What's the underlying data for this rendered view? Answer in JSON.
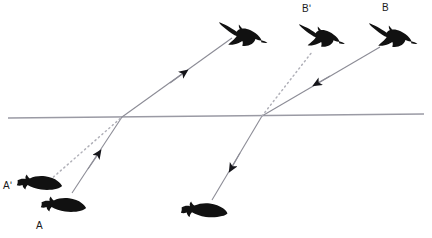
{
  "diagram": {
    "type": "optics-ray-diagram",
    "colors": {
      "background": "#ffffff",
      "silhouette": "#111111",
      "ray_solid": "#8c8c96",
      "ray_dotted": "#b8b8c0",
      "surface_line": "#9a9aa4",
      "label_text": "#1a1a1a"
    },
    "surface": {
      "name": "water-surface-line",
      "style": "solid",
      "x1": 8,
      "y1": 118,
      "x2": 424,
      "y2": 114
    },
    "labels": [
      {
        "id": "a-prime",
        "text": "Aʹ",
        "x": 3,
        "y": 181,
        "describes": "apparent-position-of-fish"
      },
      {
        "id": "a",
        "text": "A",
        "x": 36,
        "y": 221,
        "describes": "real-position-of-fish"
      },
      {
        "id": "b-prime",
        "text": "Bʹ",
        "x": 302,
        "y": 4,
        "describes": "apparent-position-of-bird"
      },
      {
        "id": "b",
        "text": "B",
        "x": 382,
        "y": 3,
        "describes": "real-position-of-bird"
      }
    ],
    "objects": [
      {
        "id": "fish-real-left",
        "kind": "fish",
        "label": "A",
        "cx": 62,
        "cy": 204,
        "scale": 1.0,
        "flip": false,
        "note": "real fish below surface, left pair"
      },
      {
        "id": "fish-apparent-left",
        "kind": "fish",
        "label": "Aʹ",
        "cx": 38,
        "cy": 183,
        "scale": 1.0,
        "flip": false,
        "note": "apparent (raised) image of the fish"
      },
      {
        "id": "fish-real-right",
        "kind": "fish",
        "label": "",
        "cx": 203,
        "cy": 210,
        "scale": 1.05,
        "flip": false,
        "note": "fish viewing the bird from under water"
      },
      {
        "id": "bird-left",
        "kind": "bird",
        "label": "",
        "cx": 240,
        "cy": 36,
        "scale": 1.0,
        "flip": false,
        "note": "bird seen by the fish"
      },
      {
        "id": "bird-apparent",
        "kind": "bird",
        "label": "Bʹ",
        "cx": 318,
        "cy": 37,
        "scale": 0.95,
        "flip": false,
        "note": "apparent (raised) image of the bird"
      },
      {
        "id": "bird-real",
        "kind": "bird",
        "label": "B",
        "cx": 390,
        "cy": 38,
        "scale": 1.0,
        "flip": false,
        "note": "real bird above surface"
      }
    ],
    "rays": [
      {
        "id": "ray-fish-to-eye-water",
        "style": "solid",
        "arrow": "mid-forward",
        "points": "72,193 122,117",
        "note": "incident ray in water from real fish A up to the surface"
      },
      {
        "id": "ray-fish-to-eye-air",
        "style": "solid",
        "arrow": "mid-forward",
        "points": "122,117 232,38",
        "note": "refracted ray in air travelling to the observing bird"
      },
      {
        "id": "ray-apparent-fish",
        "style": "dotted",
        "arrow": "none",
        "points": "50,180 122,117",
        "note": "backward extension of the refracted ray giving apparent fish position Aʹ"
      },
      {
        "id": "ray-bird-to-surface",
        "style": "solid",
        "arrow": "mid-backward",
        "points": "380,47 262,116",
        "note": "incident ray in air from real bird B down to the surface"
      },
      {
        "id": "ray-surface-to-fish",
        "style": "solid",
        "arrow": "mid-backward",
        "points": "262,116 212,200",
        "note": "refracted ray in water travelling to the observing fish"
      },
      {
        "id": "ray-apparent-bird",
        "style": "dotted",
        "arrow": "none",
        "points": "262,116 312,52",
        "note": "backward extension of the refracted ray giving apparent bird position Bʹ"
      }
    ]
  }
}
